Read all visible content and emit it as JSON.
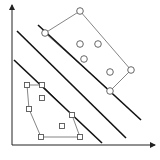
{
  "diagram": {
    "colors": {
      "axis": "#222222",
      "line": "#111111",
      "hull": "#666666",
      "marker": "#555555",
      "background": "#ffffff"
    },
    "axes": {
      "origin": [
        12,
        145
      ],
      "y_end": [
        12,
        5
      ],
      "x_end": [
        155,
        145
      ]
    },
    "lines": [
      {
        "name": "upper-margin",
        "from": [
          38,
          25
        ],
        "to": [
          141,
          120
        ]
      },
      {
        "name": "hyperplane",
        "from": [
          17,
          31
        ],
        "to": [
          126,
          138
        ]
      },
      {
        "name": "lower-margin",
        "from": [
          14,
          60
        ],
        "to": [
          102,
          143
        ]
      }
    ],
    "class_circles": {
      "points": [
        [
          80,
          11
        ],
        [
          45,
          33
        ],
        [
          80,
          44
        ],
        [
          98,
          44
        ],
        [
          84,
          59
        ],
        [
          110,
          72
        ],
        [
          131,
          70
        ],
        [
          110,
          91
        ]
      ],
      "hull": [
        [
          45,
          33
        ],
        [
          80,
          11
        ],
        [
          131,
          70
        ],
        [
          110,
          91
        ]
      ]
    },
    "class_squares": {
      "points": [
        [
          27,
          85
        ],
        [
          42,
          85
        ],
        [
          42,
          98
        ],
        [
          29,
          109
        ],
        [
          72,
          115
        ],
        [
          62,
          126
        ],
        [
          41,
          137
        ],
        [
          80,
          137
        ]
      ],
      "hull": [
        [
          27,
          85
        ],
        [
          42,
          85
        ],
        [
          72,
          115
        ],
        [
          80,
          137
        ],
        [
          41,
          137
        ],
        [
          29,
          109
        ]
      ]
    },
    "caption": ""
  }
}
